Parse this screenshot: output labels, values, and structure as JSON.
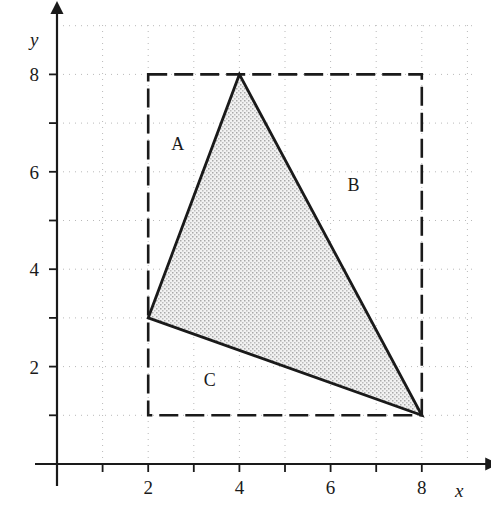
{
  "crop_text": ". .    . .              .",
  "chart_data": {
    "type": "scatter",
    "title": "",
    "xlabel": "x",
    "ylabel": "y",
    "xlim": [
      0,
      9.2
    ],
    "ylim": [
      0,
      9.1
    ],
    "grid": true,
    "grid_style": "dotted",
    "grid_step": 1,
    "x_ticks": [
      1,
      2,
      3,
      4,
      5,
      6,
      7,
      8
    ],
    "y_ticks": [
      1,
      2,
      3,
      4,
      5,
      6,
      7,
      8
    ],
    "x_tick_labels": [
      "",
      "2",
      "",
      "4",
      "",
      "6",
      "",
      "8"
    ],
    "y_tick_labels": [
      "",
      "2",
      "",
      "4",
      "",
      "6",
      "",
      "8"
    ],
    "legend_position": "none",
    "shapes": [
      {
        "name": "bounding-rectangle",
        "type": "rect",
        "x0": 2,
        "y0": 1,
        "x1": 8,
        "y1": 8,
        "stroke": "#1a1a1a",
        "stroke_width": 2.6,
        "dash": "19 7",
        "fill": "none"
      },
      {
        "name": "shaded-triangle",
        "type": "polygon",
        "points": [
          [
            4,
            8
          ],
          [
            8,
            1
          ],
          [
            2,
            3
          ]
        ],
        "stroke": "#1a1a1a",
        "stroke_width": 2.8,
        "fill": "stipple-gray"
      }
    ],
    "annotations": [
      {
        "text": "A",
        "x": 2.65,
        "y": 6.45
      },
      {
        "text": "B",
        "x": 6.5,
        "y": 5.6
      },
      {
        "text": "C",
        "x": 3.35,
        "y": 1.6
      }
    ],
    "colors": {
      "axis": "#1a1a1a",
      "grid": "#b9b9b9",
      "shape_stroke": "#1a1a1a",
      "shape_fill": "#d8d8d8",
      "background": "#ffffff"
    }
  }
}
